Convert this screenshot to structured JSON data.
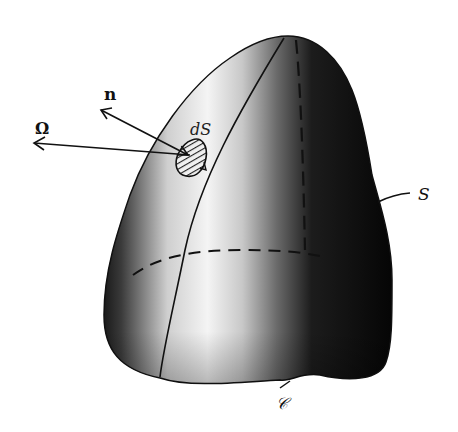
{
  "figure": {
    "labels": {
      "normal": "n",
      "omega": "Ω",
      "surface_element": "dS",
      "surface": "S",
      "boundary_curve": "𝒞"
    },
    "colors": {
      "background": "#ffffff",
      "surface_light": "#f2f2f2",
      "surface_dark": "#050505",
      "lines": "#111111"
    }
  }
}
